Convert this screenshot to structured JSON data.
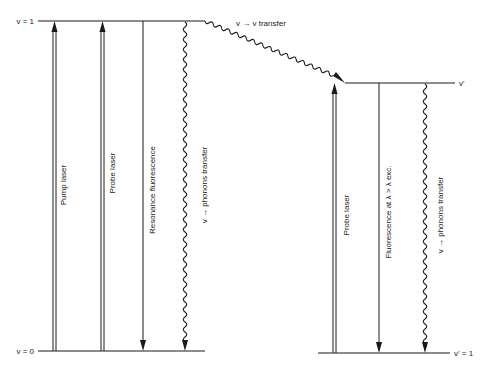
{
  "diagram": {
    "type": "energy-level-diagram",
    "colors": {
      "line": "#1a1a1a",
      "background": "#ffffff"
    },
    "levels": {
      "upper_left": "v = 1",
      "lower_left": "v = 0",
      "upper_right": "v'",
      "lower_right": "v' = 1"
    },
    "transfer_label": "v → v transfer",
    "left_transitions": [
      {
        "label": "Pump laser",
        "kind": "double-arrow-up"
      },
      {
        "label": "Probe laser",
        "kind": "double-arrow-up"
      },
      {
        "label": "Resonance fluorescence",
        "kind": "arrow-down"
      },
      {
        "label": "v → phonons transfer",
        "kind": "wavy-arrow-down"
      }
    ],
    "right_transitions": [
      {
        "label": "Probe laser",
        "kind": "double-arrow-up"
      },
      {
        "label": "Fluorescence at λ > λ exc.",
        "kind": "arrow-down"
      },
      {
        "label": "v → phonons transfer",
        "kind": "wavy-arrow-down"
      }
    ]
  }
}
